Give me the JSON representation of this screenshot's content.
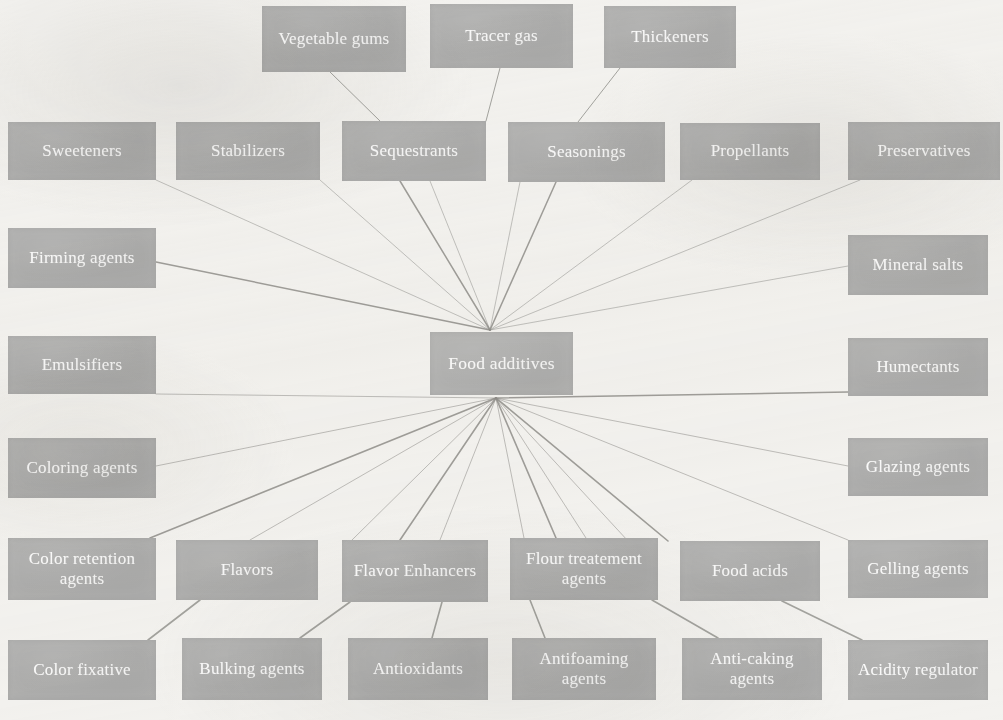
{
  "diagram": {
    "type": "mind-map",
    "title": "Food additives",
    "background_color": "#f3f2ef",
    "node_fill_color": "#adaca8",
    "node_text_color": "#fbfbfa",
    "edge_color": "#8f8e8a",
    "center": {
      "id": "food-additives",
      "label": "Food additives",
      "x": 430,
      "y": 332,
      "w": 143,
      "h": 63
    },
    "nodes": [
      {
        "id": "vegetable-gums",
        "label": "Vegetable gums",
        "x": 262,
        "y": 6,
        "w": 144,
        "h": 66
      },
      {
        "id": "tracer-gas",
        "label": "Tracer gas",
        "x": 430,
        "y": 4,
        "w": 143,
        "h": 64
      },
      {
        "id": "thickeners",
        "label": "Thickeners",
        "x": 604,
        "y": 6,
        "w": 132,
        "h": 62
      },
      {
        "id": "sweeteners",
        "label": "Sweeteners",
        "x": 8,
        "y": 122,
        "w": 148,
        "h": 58
      },
      {
        "id": "stabilizers",
        "label": "Stabilizers",
        "x": 176,
        "y": 122,
        "w": 144,
        "h": 58
      },
      {
        "id": "sequestrants",
        "label": "Sequestrants",
        "x": 342,
        "y": 121,
        "w": 144,
        "h": 60
      },
      {
        "id": "seasonings",
        "label": "Seasonings",
        "x": 508,
        "y": 122,
        "w": 157,
        "h": 60
      },
      {
        "id": "propellants",
        "label": "Propellants",
        "x": 680,
        "y": 123,
        "w": 140,
        "h": 57
      },
      {
        "id": "preservatives",
        "label": "Preservatives",
        "x": 848,
        "y": 122,
        "w": 152,
        "h": 58
      },
      {
        "id": "firming-agents",
        "label": "Firming agents",
        "x": 8,
        "y": 228,
        "w": 148,
        "h": 60
      },
      {
        "id": "mineral-salts",
        "label": "Mineral salts",
        "x": 848,
        "y": 235,
        "w": 140,
        "h": 60
      },
      {
        "id": "emulsifiers",
        "label": "Emulsifiers",
        "x": 8,
        "y": 336,
        "w": 148,
        "h": 58
      },
      {
        "id": "humectants",
        "label": "Humectants",
        "x": 848,
        "y": 338,
        "w": 140,
        "h": 58
      },
      {
        "id": "coloring-agents",
        "label": "Coloring agents",
        "x": 8,
        "y": 438,
        "w": 148,
        "h": 60
      },
      {
        "id": "glazing-agents",
        "label": "Glazing agents",
        "x": 848,
        "y": 438,
        "w": 140,
        "h": 58
      },
      {
        "id": "color-retention-agents",
        "label": "Color retention agents",
        "x": 8,
        "y": 538,
        "w": 148,
        "h": 62
      },
      {
        "id": "flavors",
        "label": "Flavors",
        "x": 176,
        "y": 540,
        "w": 142,
        "h": 60
      },
      {
        "id": "flavor-enhancers",
        "label": "Flavor Enhancers",
        "x": 342,
        "y": 540,
        "w": 146,
        "h": 62
      },
      {
        "id": "flour-treatement-agents",
        "label": "Flour treatement agents",
        "x": 510,
        "y": 538,
        "w": 148,
        "h": 62
      },
      {
        "id": "food-acids",
        "label": "Food acids",
        "x": 680,
        "y": 541,
        "w": 140,
        "h": 60
      },
      {
        "id": "gelling-agents",
        "label": "Gelling agents",
        "x": 848,
        "y": 540,
        "w": 140,
        "h": 58
      },
      {
        "id": "color-fixative",
        "label": "Color fixative",
        "x": 8,
        "y": 640,
        "w": 148,
        "h": 60
      },
      {
        "id": "bulking-agents",
        "label": "Bulking agents",
        "x": 182,
        "y": 638,
        "w": 140,
        "h": 62
      },
      {
        "id": "antioxidants",
        "label": "Antioxidants",
        "x": 348,
        "y": 638,
        "w": 140,
        "h": 62
      },
      {
        "id": "antifoaming-agents",
        "label": "Antifoaming agents",
        "x": 512,
        "y": 638,
        "w": 144,
        "h": 62
      },
      {
        "id": "anti-caking-agents",
        "label": "Anti-caking agents",
        "x": 682,
        "y": 638,
        "w": 140,
        "h": 62
      },
      {
        "id": "acidity-regulator",
        "label": "Acidity regulator",
        "x": 848,
        "y": 640,
        "w": 140,
        "h": 60
      }
    ],
    "hub_top": {
      "x": 490,
      "y": 330
    },
    "hub_bottom": {
      "x": 496,
      "y": 398
    },
    "edges_to_hub_top": [
      {
        "from": "sweeteners",
        "fx": 156,
        "fy": 180
      },
      {
        "from": "stabilizers",
        "fx": 320,
        "fy": 180
      },
      {
        "from": "sequestrants",
        "fx": 400,
        "fy": 181
      },
      {
        "from": "sequestrants2",
        "fx": 430,
        "fy": 181
      },
      {
        "from": "seasonings",
        "fx": 520,
        "fy": 182
      },
      {
        "from": "seasonings2",
        "fx": 556,
        "fy": 182
      },
      {
        "from": "propellants",
        "fx": 692,
        "fy": 180
      },
      {
        "from": "preservatives",
        "fx": 860,
        "fy": 180
      },
      {
        "from": "firming-agents",
        "fx": 156,
        "fy": 262
      },
      {
        "from": "mineral-salts",
        "fx": 848,
        "fy": 266
      }
    ],
    "edges_to_hub_bottom": [
      {
        "to": "emulsifiers",
        "tx": 156,
        "ty": 394
      },
      {
        "to": "humectants",
        "tx": 848,
        "ty": 392
      },
      {
        "to": "coloring-agents",
        "tx": 156,
        "ty": 466
      },
      {
        "to": "glazing-agents",
        "tx": 848,
        "ty": 466
      },
      {
        "to": "color-retention-agents",
        "tx": 150,
        "ty": 538
      },
      {
        "to": "flavors",
        "tx": 250,
        "ty": 540
      },
      {
        "to": "flavor-enhancers",
        "tx": 352,
        "ty": 540
      },
      {
        "to": "flavor-enhancers2",
        "tx": 400,
        "ty": 540
      },
      {
        "to": "flavor-enhancers3",
        "tx": 440,
        "ty": 540
      },
      {
        "to": "flour-treatement-agents",
        "tx": 524,
        "ty": 538
      },
      {
        "to": "flour-treatement2",
        "tx": 556,
        "ty": 538
      },
      {
        "to": "flour-treatement3",
        "tx": 586,
        "ty": 538
      },
      {
        "to": "food-acids",
        "tx": 628,
        "ty": 541
      },
      {
        "to": "food-acids2",
        "tx": 668,
        "ty": 541
      },
      {
        "to": "gelling-agents",
        "tx": 848,
        "ty": 540
      }
    ],
    "edges_direct": [
      {
        "from": "vegetable-gums",
        "fx": 330,
        "fy": 72,
        "to": "sequestrants",
        "tx": 380,
        "ty": 121
      },
      {
        "from": "tracer-gas",
        "fx": 500,
        "fy": 68,
        "to": "sequestrants-right",
        "tx": 486,
        "ty": 121
      },
      {
        "from": "thickeners",
        "fx": 620,
        "fy": 68,
        "to": "seasonings",
        "tx": 578,
        "ty": 122
      },
      {
        "from": "flavors",
        "fx": 200,
        "fy": 600,
        "to": "color-fixative",
        "tx": 148,
        "ty": 640
      },
      {
        "from": "flavor-enhancers",
        "fx": 350,
        "fy": 602,
        "to": "bulking-agents",
        "tx": 300,
        "ty": 638
      },
      {
        "from": "flavor-enhancers",
        "fx": 442,
        "fy": 602,
        "to": "antioxidants",
        "tx": 432,
        "ty": 638
      },
      {
        "from": "flour-treatement-agents",
        "fx": 530,
        "fy": 600,
        "to": "antifoaming-agents",
        "tx": 545,
        "ty": 638
      },
      {
        "from": "flour-treatement-agents",
        "fx": 652,
        "fy": 600,
        "to": "anti-caking-agents",
        "tx": 718,
        "ty": 638
      },
      {
        "from": "food-acids",
        "fx": 782,
        "fy": 601,
        "to": "acidity-regulator",
        "tx": 862,
        "ty": 640
      }
    ]
  }
}
